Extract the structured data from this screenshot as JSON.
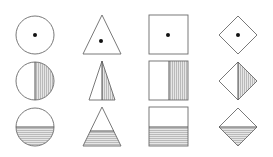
{
  "diagram": {
    "columns": [
      "circle",
      "triangle",
      "square",
      "diamond"
    ],
    "rows": [
      {
        "variant": "center-dot",
        "label": "Shapes with center dot"
      },
      {
        "variant": "right-half-vertical-hatch",
        "label": "Shapes with right half shaded (vertical lines)"
      },
      {
        "variant": "bottom-half-horizontal-hatch",
        "label": "Shapes with bottom portion shaded (horizontal lines)"
      }
    ],
    "colors": {
      "stroke": "#6a6a6a",
      "dot": "#111111",
      "hatch": "#9a9a9a",
      "fill": "#e4e4e4",
      "background": "#ffffff"
    }
  }
}
